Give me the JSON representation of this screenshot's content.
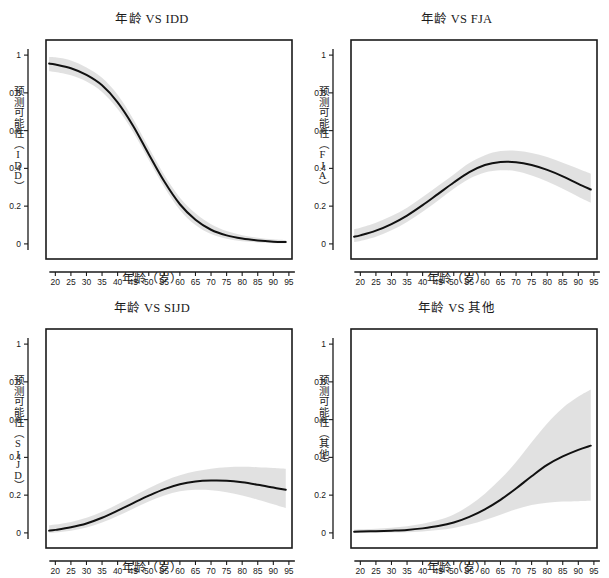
{
  "figure": {
    "layout": "2x2 grid of logistic prediction plots",
    "background": "#ffffff",
    "curve_color": "#111111",
    "band_color": "#cfcfcf",
    "frame_color": "#1a1a1a"
  },
  "common": {
    "xlabel": "年龄（岁）",
    "x_ticks": [
      "20",
      "25",
      "30",
      "35",
      "40",
      "45",
      "50",
      "55",
      "60",
      "65",
      "70",
      "75",
      "80",
      "85",
      "90",
      "95"
    ],
    "y_ticks": [
      "0.0",
      "0.2",
      "0.4",
      "0.6",
      "0.8",
      "1.0"
    ]
  },
  "chart_data": [
    {
      "type": "line",
      "panel": "top-left",
      "title": "年龄 VS IDD",
      "xlabel": "年龄（岁）",
      "ylabel": "预测可能性（IDD）",
      "xlim": [
        17,
        96
      ],
      "ylim": [
        -0.08,
        1.08
      ],
      "xticks": [
        20,
        25,
        30,
        35,
        40,
        45,
        50,
        55,
        60,
        65,
        70,
        75,
        80,
        85,
        90,
        95
      ],
      "yticks": [
        0.0,
        0.2,
        0.4,
        0.6,
        0.8,
        1.0
      ],
      "grid": false,
      "legend": "none",
      "x": [
        18,
        20,
        25,
        30,
        35,
        40,
        45,
        50,
        55,
        60,
        65,
        70,
        75,
        80,
        85,
        90,
        94
      ],
      "series": [
        {
          "name": "预测可能性",
          "values": [
            0.955,
            0.95,
            0.93,
            0.895,
            0.84,
            0.75,
            0.625,
            0.475,
            0.33,
            0.21,
            0.128,
            0.075,
            0.045,
            0.028,
            0.018,
            0.012,
            0.01
          ]
        }
      ],
      "band": {
        "name": "95%置信区间",
        "lower": [
          0.915,
          0.91,
          0.893,
          0.86,
          0.805,
          0.714,
          0.592,
          0.445,
          0.3,
          0.18,
          0.1,
          0.052,
          0.027,
          0.014,
          0.008,
          0.004,
          0.003
        ],
        "upper": [
          0.99,
          0.988,
          0.972,
          0.935,
          0.88,
          0.79,
          0.662,
          0.51,
          0.365,
          0.245,
          0.162,
          0.104,
          0.068,
          0.046,
          0.033,
          0.024,
          0.02
        ]
      }
    },
    {
      "type": "line",
      "panel": "top-right",
      "title": "年龄 VS FJA",
      "xlabel": "年龄（岁）",
      "ylabel": "预测可能性（FJA）",
      "xlim": [
        17,
        96
      ],
      "ylim": [
        -0.08,
        1.08
      ],
      "xticks": [
        20,
        25,
        30,
        35,
        40,
        45,
        50,
        55,
        60,
        65,
        70,
        75,
        80,
        85,
        90,
        95
      ],
      "yticks": [
        0.0,
        0.2,
        0.4,
        0.6,
        0.8,
        1.0
      ],
      "grid": false,
      "legend": "none",
      "x": [
        18,
        20,
        25,
        30,
        35,
        40,
        45,
        50,
        55,
        60,
        65,
        70,
        75,
        80,
        85,
        90,
        94
      ],
      "series": [
        {
          "name": "预测可能性",
          "values": [
            0.038,
            0.045,
            0.07,
            0.105,
            0.15,
            0.205,
            0.265,
            0.325,
            0.38,
            0.418,
            0.434,
            0.433,
            0.418,
            0.392,
            0.358,
            0.318,
            0.288
          ]
        }
      ],
      "band": {
        "name": "95%置信区间",
        "lower": [
          0.01,
          0.016,
          0.038,
          0.072,
          0.116,
          0.17,
          0.23,
          0.292,
          0.345,
          0.378,
          0.39,
          0.385,
          0.362,
          0.33,
          0.292,
          0.25,
          0.218
        ],
        "upper": [
          0.078,
          0.086,
          0.112,
          0.148,
          0.192,
          0.248,
          0.308,
          0.368,
          0.428,
          0.47,
          0.492,
          0.494,
          0.482,
          0.46,
          0.43,
          0.398,
          0.372
        ]
      }
    },
    {
      "type": "line",
      "panel": "bottom-left",
      "title": "年龄 VS SIJD",
      "xlabel": "年龄（岁）",
      "ylabel": "预测可能性（SIJD）",
      "xlim": [
        17,
        96
      ],
      "ylim": [
        -0.08,
        1.08
      ],
      "xticks": [
        20,
        25,
        30,
        35,
        40,
        45,
        50,
        55,
        60,
        65,
        70,
        75,
        80,
        85,
        90,
        95
      ],
      "yticks": [
        0.0,
        0.2,
        0.4,
        0.6,
        0.8,
        1.0
      ],
      "grid": false,
      "legend": "none",
      "x": [
        18,
        20,
        25,
        30,
        35,
        40,
        45,
        50,
        55,
        60,
        65,
        70,
        75,
        80,
        85,
        90,
        94
      ],
      "series": [
        {
          "name": "预测可能性",
          "values": [
            0.012,
            0.016,
            0.03,
            0.05,
            0.08,
            0.118,
            0.158,
            0.197,
            0.232,
            0.258,
            0.272,
            0.277,
            0.276,
            0.268,
            0.255,
            0.24,
            0.228
          ]
        }
      ],
      "band": {
        "name": "95%置信区间",
        "lower": [
          0.0,
          0.002,
          0.012,
          0.028,
          0.055,
          0.09,
          0.128,
          0.166,
          0.198,
          0.22,
          0.228,
          0.226,
          0.215,
          0.198,
          0.176,
          0.152,
          0.132
        ],
        "upper": [
          0.04,
          0.044,
          0.058,
          0.08,
          0.112,
          0.152,
          0.194,
          0.236,
          0.275,
          0.305,
          0.326,
          0.34,
          0.348,
          0.35,
          0.348,
          0.344,
          0.34
        ]
      }
    },
    {
      "type": "line",
      "panel": "bottom-right",
      "title": "年龄 VS 其他",
      "xlabel": "年龄（岁）",
      "ylabel": "预测可能性（其他）",
      "xlim": [
        17,
        96
      ],
      "ylim": [
        -0.08,
        1.08
      ],
      "xticks": [
        20,
        25,
        30,
        35,
        40,
        45,
        50,
        55,
        60,
        65,
        70,
        75,
        80,
        85,
        90,
        95
      ],
      "yticks": [
        0.0,
        0.2,
        0.4,
        0.6,
        0.8,
        1.0
      ],
      "grid": false,
      "legend": "none",
      "x": [
        18,
        20,
        25,
        30,
        35,
        40,
        45,
        50,
        55,
        60,
        65,
        70,
        75,
        80,
        85,
        90,
        94
      ],
      "series": [
        {
          "name": "预测可能性",
          "values": [
            0.006,
            0.007,
            0.009,
            0.012,
            0.016,
            0.024,
            0.036,
            0.055,
            0.085,
            0.125,
            0.175,
            0.235,
            0.3,
            0.36,
            0.405,
            0.44,
            0.462
          ]
        }
      ],
      "band": {
        "name": "95%置信区间",
        "lower": [
          0.0,
          0.0,
          0.001,
          0.002,
          0.004,
          0.008,
          0.015,
          0.026,
          0.044,
          0.068,
          0.096,
          0.125,
          0.148,
          0.16,
          0.166,
          0.168,
          0.17
        ],
        "upper": [
          0.018,
          0.019,
          0.022,
          0.027,
          0.035,
          0.048,
          0.068,
          0.098,
          0.145,
          0.208,
          0.285,
          0.375,
          0.48,
          0.58,
          0.662,
          0.722,
          0.76
        ]
      }
    }
  ]
}
